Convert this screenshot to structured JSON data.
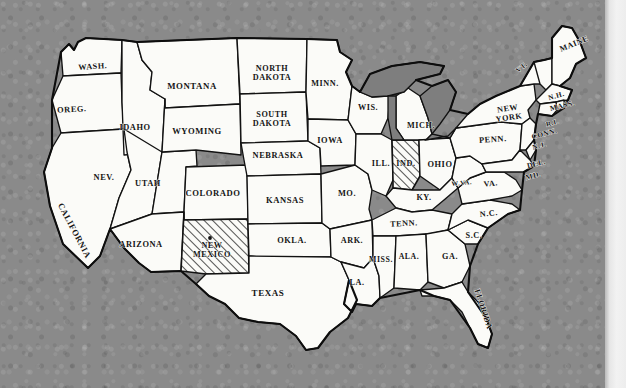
{
  "image": {
    "kind": "scanned-map",
    "title": "Outline map of the United States",
    "background_color": "#8a8a8a",
    "land_color": "#fbfbf8",
    "border_color": "#121212",
    "lake_color": "#7e7e7e",
    "page_margin_color": "#efefef"
  },
  "legend": {
    "highlight_style": "diagonal-hatch",
    "highlighted_states": [
      "NEW MEXICO",
      "IND."
    ],
    "marker": {
      "state": "NEW MEXICO",
      "symbol": "dot"
    }
  },
  "states": [
    {
      "id": "washington",
      "label": "WASH.",
      "x": 93,
      "y": 69,
      "rotate": -4,
      "size": 8.2,
      "lines": [
        "WASH."
      ]
    },
    {
      "id": "oregon",
      "label": "OREG.",
      "x": 72,
      "y": 112,
      "rotate": -3,
      "size": 8.4,
      "lines": [
        "OREG."
      ]
    },
    {
      "id": "california",
      "label": "CALIFORNIA",
      "x": 72,
      "y": 232,
      "rotate": 62,
      "size": 8.6,
      "lines": [
        "CALIFORNIA"
      ]
    },
    {
      "id": "idaho",
      "label": "IDAHO",
      "x": 135,
      "y": 130,
      "rotate": 0,
      "size": 8.4,
      "lines": [
        "IDAHO"
      ]
    },
    {
      "id": "nevada",
      "label": "NEV.",
      "x": 104,
      "y": 180,
      "rotate": 0,
      "size": 8.4,
      "lines": [
        "NEV."
      ]
    },
    {
      "id": "utah",
      "label": "UTAH",
      "x": 148,
      "y": 186,
      "rotate": 0,
      "size": 8.4,
      "lines": [
        "UTAH"
      ]
    },
    {
      "id": "arizona",
      "label": "ARIZONA",
      "x": 141,
      "y": 247,
      "rotate": 0,
      "size": 8.4,
      "lines": [
        "ARIZONA"
      ]
    },
    {
      "id": "montana",
      "label": "MONTANA",
      "x": 192,
      "y": 89,
      "rotate": 0,
      "size": 8.8,
      "lines": [
        "MONTANA"
      ]
    },
    {
      "id": "wyoming",
      "label": "WYOMING",
      "x": 197,
      "y": 134,
      "rotate": 0,
      "size": 8.6,
      "lines": [
        "WYOMING"
      ]
    },
    {
      "id": "colorado",
      "label": "COLORADO",
      "x": 213,
      "y": 196,
      "rotate": 0,
      "size": 8.6,
      "lines": [
        "COLORADO"
      ]
    },
    {
      "id": "new-mexico",
      "label": "NEW MEXICO",
      "x": 212,
      "y": 248,
      "rotate": 0,
      "size": 8.2,
      "lines": [
        "NEW",
        "MEXICO"
      ],
      "highlight": true
    },
    {
      "id": "north-dakota",
      "label": "NORTH DAKOTA",
      "x": 272,
      "y": 71,
      "rotate": 0,
      "size": 8.2,
      "lines": [
        "NORTH",
        "DAKOTA"
      ]
    },
    {
      "id": "south-dakota",
      "label": "SOUTH DAKOTA",
      "x": 272,
      "y": 117,
      "rotate": 0,
      "size": 8.2,
      "lines": [
        "SOUTH",
        "DAKOTA"
      ]
    },
    {
      "id": "nebraska",
      "label": "NEBRASKA",
      "x": 278,
      "y": 158,
      "rotate": 0,
      "size": 8.4,
      "lines": [
        "NEBRASKA"
      ]
    },
    {
      "id": "kansas",
      "label": "KANSAS",
      "x": 285,
      "y": 203,
      "rotate": 0,
      "size": 8.6,
      "lines": [
        "KANSAS"
      ]
    },
    {
      "id": "oklahoma",
      "label": "OKLA.",
      "x": 292,
      "y": 243,
      "rotate": 0,
      "size": 8.4,
      "lines": [
        "OKLA."
      ]
    },
    {
      "id": "texas",
      "label": "TEXAS",
      "x": 268,
      "y": 296,
      "rotate": 0,
      "size": 9.0,
      "lines": [
        "TEXAS"
      ]
    },
    {
      "id": "minnesota",
      "label": "MINN.",
      "x": 325,
      "y": 86,
      "rotate": 0,
      "size": 8.2,
      "lines": [
        "MINN."
      ]
    },
    {
      "id": "iowa",
      "label": "IOWA",
      "x": 330,
      "y": 143,
      "rotate": 0,
      "size": 8.4,
      "lines": [
        "IOWA"
      ]
    },
    {
      "id": "missouri",
      "label": "MO.",
      "x": 347,
      "y": 196,
      "rotate": 0,
      "size": 8.4,
      "lines": [
        "MO."
      ]
    },
    {
      "id": "arkansas",
      "label": "ARK.",
      "x": 352,
      "y": 243,
      "rotate": 0,
      "size": 8.2,
      "lines": [
        "ARK."
      ]
    },
    {
      "id": "louisiana",
      "label": "LA.",
      "x": 357,
      "y": 285,
      "rotate": 0,
      "size": 8.2,
      "lines": [
        "LA."
      ]
    },
    {
      "id": "wisconsin",
      "label": "WIS.",
      "x": 368,
      "y": 110,
      "rotate": 0,
      "size": 8.2,
      "lines": [
        "WIS."
      ]
    },
    {
      "id": "illinois",
      "label": "ILL.",
      "x": 381,
      "y": 166,
      "rotate": 0,
      "size": 8.2,
      "lines": [
        "ILL."
      ]
    },
    {
      "id": "indiana",
      "label": "IND.",
      "x": 406,
      "y": 166,
      "rotate": 0,
      "size": 8.2,
      "lines": [
        "IND."
      ],
      "highlight": true
    },
    {
      "id": "michigan",
      "label": "MICH.",
      "x": 421,
      "y": 128,
      "rotate": 0,
      "size": 8.2,
      "lines": [
        "MICH."
      ]
    },
    {
      "id": "ohio",
      "label": "OHIO",
      "x": 440,
      "y": 167,
      "rotate": 0,
      "size": 8.4,
      "lines": [
        "OHIO"
      ]
    },
    {
      "id": "kentucky",
      "label": "KY.",
      "x": 424,
      "y": 200,
      "rotate": 0,
      "size": 8.2,
      "lines": [
        "KY."
      ]
    },
    {
      "id": "tennessee",
      "label": "TENN.",
      "x": 404,
      "y": 226,
      "rotate": -3,
      "size": 8.2,
      "lines": [
        "TENN."
      ]
    },
    {
      "id": "mississippi",
      "label": "MISS.",
      "x": 381,
      "y": 262,
      "rotate": 0,
      "size": 7.8,
      "lines": [
        "MISS."
      ]
    },
    {
      "id": "alabama",
      "label": "ALA.",
      "x": 409,
      "y": 259,
      "rotate": 0,
      "size": 7.8,
      "lines": [
        "ALA."
      ]
    },
    {
      "id": "georgia",
      "label": "GA.",
      "x": 450,
      "y": 259,
      "rotate": 0,
      "size": 8.2,
      "lines": [
        "GA."
      ]
    },
    {
      "id": "florida",
      "label": "FLORIDA",
      "x": 481,
      "y": 310,
      "rotate": 72,
      "size": 8.2,
      "lines": [
        "FLORIDA"
      ]
    },
    {
      "id": "south-carolina",
      "label": "S.C.",
      "x": 474,
      "y": 238,
      "rotate": 0,
      "size": 8.2,
      "lines": [
        "S.C."
      ]
    },
    {
      "id": "north-carolina",
      "label": "N.C.",
      "x": 489,
      "y": 216,
      "rotate": -6,
      "size": 8.2,
      "lines": [
        "N.C."
      ]
    },
    {
      "id": "virginia",
      "label": "VA.",
      "x": 491,
      "y": 186,
      "rotate": -6,
      "size": 8.0,
      "lines": [
        "VA."
      ]
    },
    {
      "id": "west-virginia",
      "label": "W.VA.",
      "x": 462,
      "y": 185,
      "rotate": -6,
      "size": 6.6,
      "lines": [
        "W.VA."
      ]
    },
    {
      "id": "pennsylvania",
      "label": "PENN.",
      "x": 493,
      "y": 142,
      "rotate": -4,
      "size": 8.4,
      "lines": [
        "PENN."
      ]
    },
    {
      "id": "new-york",
      "label": "NEW YORK",
      "x": 508,
      "y": 111,
      "rotate": -8,
      "size": 8.2,
      "lines": [
        "NEW",
        "YORK"
      ]
    },
    {
      "id": "vermont",
      "label": "VT.",
      "x": 523,
      "y": 69,
      "rotate": -38,
      "size": 7.2,
      "lines": [
        "VT."
      ]
    },
    {
      "id": "new-hampshire",
      "label": "N.H.",
      "x": 557,
      "y": 98,
      "rotate": -16,
      "size": 7.2,
      "lines": [
        "N.H."
      ]
    },
    {
      "id": "maine",
      "label": "MAINE",
      "x": 575,
      "y": 46,
      "rotate": -22,
      "size": 8.0,
      "lines": [
        "MAINE"
      ]
    },
    {
      "id": "massachusetts",
      "label": "MASS.",
      "x": 563,
      "y": 108,
      "rotate": -13,
      "size": 7.6,
      "lines": [
        "MASS."
      ]
    },
    {
      "id": "rhode-island",
      "label": "R.I.",
      "x": 553,
      "y": 125,
      "rotate": -16,
      "size": 6.8,
      "lines": [
        "R.I."
      ]
    },
    {
      "id": "connecticut",
      "label": "CONN.",
      "x": 545,
      "y": 136,
      "rotate": -14,
      "size": 7.4,
      "lines": [
        "CONN."
      ]
    },
    {
      "id": "new-jersey",
      "label": "N.J.",
      "x": 540,
      "y": 148,
      "rotate": -14,
      "size": 7.2,
      "lines": [
        "N.J."
      ]
    },
    {
      "id": "delaware",
      "label": "DEL.",
      "x": 537,
      "y": 166,
      "rotate": -14,
      "size": 7.4,
      "lines": [
        "DEL."
      ]
    },
    {
      "id": "maryland",
      "label": "MD.",
      "x": 534,
      "y": 178,
      "rotate": -14,
      "size": 7.4,
      "lines": [
        "MD."
      ]
    }
  ]
}
